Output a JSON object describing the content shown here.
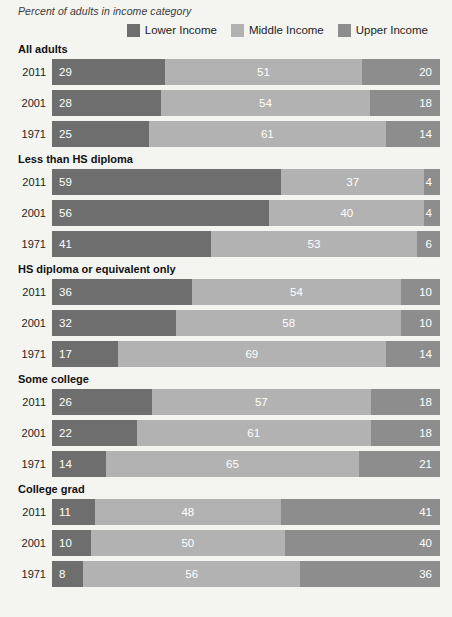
{
  "chart_data": {
    "type": "bar",
    "subtype": "stacked-bar-100",
    "orientation": "horizontal",
    "title": "Percent of adults in income category",
    "xlabel": "",
    "ylabel": "",
    "xlim": [
      0,
      100
    ],
    "grid": false,
    "legend_position": "top-right",
    "stack_order": [
      "Lower Income",
      "Middle Income",
      "Upper Income"
    ],
    "series": [
      {
        "name": "Lower Income",
        "color": "#6e6e6e"
      },
      {
        "name": "Middle Income",
        "color": "#b2b2b2"
      },
      {
        "name": "Upper Income",
        "color": "#8d8d8d"
      }
    ],
    "groups": [
      {
        "label": "All adults",
        "rows": [
          {
            "year": "2011",
            "lower": 29,
            "middle": 51,
            "upper": 20
          },
          {
            "year": "2001",
            "lower": 28,
            "middle": 54,
            "upper": 18
          },
          {
            "year": "1971",
            "lower": 25,
            "middle": 61,
            "upper": 14
          }
        ]
      },
      {
        "label": "Less than HS diploma",
        "rows": [
          {
            "year": "2011",
            "lower": 59,
            "middle": 37,
            "upper": 4
          },
          {
            "year": "2001",
            "lower": 56,
            "middle": 40,
            "upper": 4
          },
          {
            "year": "1971",
            "lower": 41,
            "middle": 53,
            "upper": 6
          }
        ]
      },
      {
        "label": "HS diploma or equivalent only",
        "rows": [
          {
            "year": "2011",
            "lower": 36,
            "middle": 54,
            "upper": 10
          },
          {
            "year": "2001",
            "lower": 32,
            "middle": 58,
            "upper": 10
          },
          {
            "year": "1971",
            "lower": 17,
            "middle": 69,
            "upper": 14
          }
        ]
      },
      {
        "label": "Some college",
        "rows": [
          {
            "year": "2011",
            "lower": 26,
            "middle": 57,
            "upper": 18
          },
          {
            "year": "2001",
            "lower": 22,
            "middle": 61,
            "upper": 18
          },
          {
            "year": "1971",
            "lower": 14,
            "middle": 65,
            "upper": 21
          }
        ]
      },
      {
        "label": "College grad",
        "rows": [
          {
            "year": "2011",
            "lower": 11,
            "middle": 48,
            "upper": 41
          },
          {
            "year": "2001",
            "lower": 10,
            "middle": 50,
            "upper": 40
          },
          {
            "year": "1971",
            "lower": 8,
            "middle": 56,
            "upper": 36
          }
        ]
      }
    ]
  },
  "legend": {
    "items": [
      {
        "label": "Lower Income",
        "swatch_name": "legend-swatch-lower-income",
        "color": "#6e6e6e"
      },
      {
        "label": "Middle Income",
        "swatch_name": "legend-swatch-middle-income",
        "color": "#b2b2b2"
      },
      {
        "label": "Upper Income",
        "swatch_name": "legend-swatch-upper-income",
        "color": "#8d8d8d"
      }
    ]
  },
  "theme": {
    "background": "#f4f4f1",
    "text": "#1d1d1d",
    "value_label": "#ffffff"
  }
}
